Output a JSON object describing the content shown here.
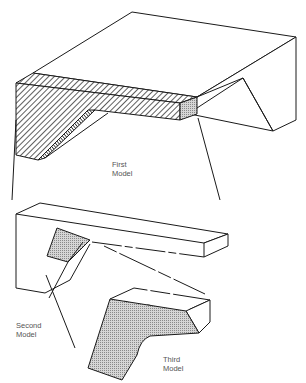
{
  "figure": {
    "type": "technical-illustration",
    "labels": {
      "first_model": "First\nModel",
      "second_model": "Second\nModel",
      "third_model": "Third\nModel"
    }
  },
  "colors": {
    "stroke": "#1a1a1a",
    "hatch": "#1a1a1a",
    "stipple": "#bdbdbd",
    "label": "#555555",
    "background": "#ffffff"
  }
}
